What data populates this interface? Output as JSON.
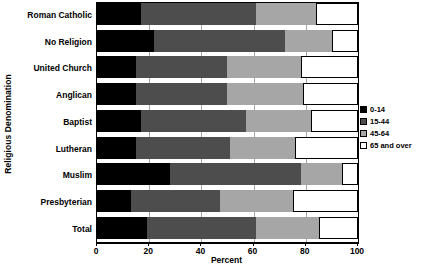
{
  "chart_data": {
    "type": "bar",
    "orientation": "horizontal",
    "stacked": true,
    "stack_mode": "percent",
    "title": "",
    "xlabel": "Percent",
    "ylabel": "Religious Denomination",
    "xlim": [
      0,
      100
    ],
    "xticks": [
      0,
      20,
      40,
      60,
      80,
      100
    ],
    "xtick_labels": [
      "0",
      "20",
      "40",
      "60",
      "80",
      "100"
    ],
    "grid": true,
    "legend_position": "right",
    "categories": [
      "Roman Catholic",
      "No Religion",
      "United Church",
      "Anglican",
      "Baptist",
      "Lutheran",
      "Muslim",
      "Presbyterian",
      "Total"
    ],
    "series": [
      {
        "name": "0-14",
        "color": "#000000",
        "values": [
          17,
          22,
          15,
          15,
          17,
          15,
          28,
          13,
          19
        ]
      },
      {
        "name": "15-44",
        "color": "#4d4d4d",
        "values": [
          44,
          50,
          35,
          35,
          40,
          36,
          50,
          34,
          42
        ]
      },
      {
        "name": "45-64",
        "color": "#a6a6a6",
        "values": [
          23,
          18,
          28,
          29,
          25,
          25,
          16,
          28,
          24
        ]
      },
      {
        "name": "65 and over",
        "color": "#ffffff",
        "values": [
          16,
          10,
          22,
          21,
          18,
          24,
          6,
          25,
          15
        ]
      }
    ],
    "legend_entries": [
      "0-14",
      "15-44",
      "45-64",
      "65 and over"
    ]
  }
}
